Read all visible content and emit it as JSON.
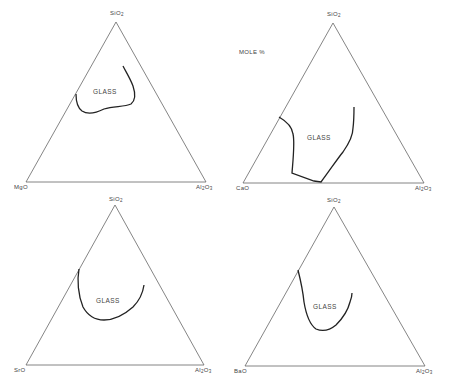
{
  "figure": {
    "units_label": "MOLE %",
    "region_label": "GLASS",
    "diagrams": [
      {
        "id": "mgo",
        "apex": "SiO2",
        "left": "MgO",
        "right": "Al2O3"
      },
      {
        "id": "cao",
        "apex": "SiO2",
        "left": "CaO",
        "right": "Al2O3"
      },
      {
        "id": "sro",
        "apex": "SiO2",
        "left": "SrO",
        "right": "Al2O3"
      },
      {
        "id": "bao",
        "apex": "SiO2",
        "left": "BaO",
        "right": "Al2O3"
      }
    ]
  },
  "labels": {
    "d1_apex_main": "SiO",
    "d1_apex_sub": "2",
    "d1_left": "MgO",
    "d1_right_a": "Al",
    "d1_right_sub1": "2",
    "d1_right_b": "O",
    "d1_right_sub2": "3",
    "d1_glass": "GLASS",
    "d2_apex_main": "SiO",
    "d2_apex_sub": "2",
    "d2_left": "CaO",
    "d2_right_a": "Al",
    "d2_right_sub1": "2",
    "d2_right_b": "O",
    "d2_right_sub2": "3",
    "d2_glass": "GLASS",
    "d3_apex_main": "SiO",
    "d3_apex_sub": "2",
    "d3_left": "SrO",
    "d3_right_a": "Al",
    "d3_right_sub1": "2",
    "d3_right_b": "O",
    "d3_right_sub2": "3",
    "d3_glass": "GLASS",
    "d4_apex_main": "SiO",
    "d4_apex_sub": "2",
    "d4_left": "BaO",
    "d4_right_a": "Al",
    "d4_right_sub1": "2",
    "d4_right_b": "O",
    "d4_right_sub2": "3",
    "d4_glass": "GLASS",
    "mole": "MOLE %"
  }
}
